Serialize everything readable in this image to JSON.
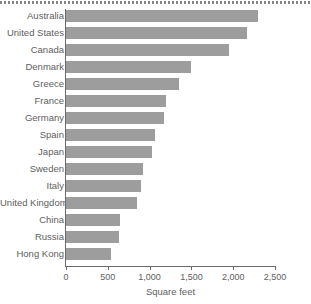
{
  "chart_data": {
    "type": "bar",
    "orientation": "horizontal",
    "title": "",
    "subtitle": "",
    "xlabel": "Square feet",
    "ylabel": "",
    "xlim": [
      0,
      2500
    ],
    "grid": false,
    "legend": null,
    "bar_color": "#9d9d9d",
    "axis_color": "#6a6a6a",
    "text_color": "#5e5e5e",
    "xticks": [
      0,
      500,
      1000,
      1500,
      2000,
      2500
    ],
    "xtick_labels": [
      "0",
      "500",
      "1,000",
      "1,500",
      "2,000",
      "2,500"
    ],
    "categories": [
      "Australia",
      "United States",
      "Canada",
      "Denmark",
      "Greece",
      "France",
      "Germany",
      "Spain",
      "Japan",
      "Sweden",
      "Italy",
      "United Kingdom",
      "China",
      "Russia",
      "Hong Kong"
    ],
    "values": [
      2300,
      2160,
      1950,
      1500,
      1350,
      1200,
      1170,
      1060,
      1030,
      920,
      900,
      850,
      650,
      630,
      540
    ],
    "points": [
      {
        "category": "Australia",
        "value": 2300
      },
      {
        "category": "United States",
        "value": 2160
      },
      {
        "category": "Canada",
        "value": 1950
      },
      {
        "category": "Denmark",
        "value": 1500
      },
      {
        "category": "Greece",
        "value": 1350
      },
      {
        "category": "France",
        "value": 1200
      },
      {
        "category": "Germany",
        "value": 1170
      },
      {
        "category": "Spain",
        "value": 1060
      },
      {
        "category": "Japan",
        "value": 1030
      },
      {
        "category": "Sweden",
        "value": 920
      },
      {
        "category": "Italy",
        "value": 900
      },
      {
        "category": "United Kingdom",
        "value": 850
      },
      {
        "category": "China",
        "value": 650
      },
      {
        "category": "Russia",
        "value": 630
      },
      {
        "category": "Hong Kong",
        "value": 540
      }
    ]
  }
}
